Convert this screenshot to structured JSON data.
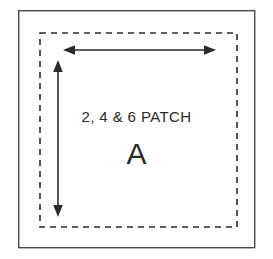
{
  "diagram": {
    "kind": "quilt-patch-template",
    "background_color": "#ffffff",
    "labels": {
      "patch_title": "2, 4 & 6 PATCH",
      "patch_letter": "A"
    },
    "outer_frame": {
      "name": "outer-border",
      "style": "solid",
      "color": "#4a4a4a",
      "stroke_width": 1.4,
      "x": 18,
      "y": 10,
      "width": 237,
      "height": 238
    },
    "cut_line": {
      "name": "dashed-cut-line",
      "style": "dashed",
      "color": "#2b2b2b",
      "stroke_width": 1.6,
      "dash_pattern": "6 5",
      "x": 40,
      "y": 33,
      "width": 197,
      "height": 194
    },
    "dimension_arrows": [
      {
        "name": "horizontal-dimension-arrow",
        "orientation": "horizontal",
        "color": "#2b2b2b",
        "stroke_width": 1.6,
        "x1": 64,
        "y1": 50,
        "x2": 215,
        "y2": 50,
        "double_headed": true
      },
      {
        "name": "vertical-dimension-arrow",
        "orientation": "vertical",
        "color": "#2b2b2b",
        "stroke_width": 1.6,
        "x1": 58,
        "y1": 61,
        "x2": 58,
        "y2": 216,
        "double_headed": true
      }
    ]
  }
}
